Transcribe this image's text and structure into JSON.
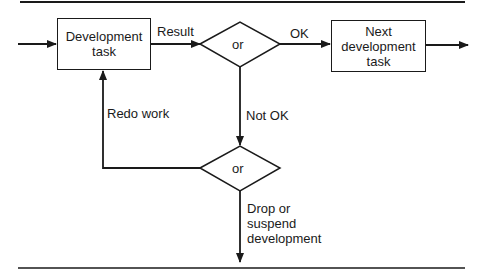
{
  "diagram": {
    "nodes": {
      "development_task": {
        "label": "Development task",
        "line1": "Development",
        "line2": "task"
      },
      "decision_1": {
        "label": "or"
      },
      "next_task": {
        "label": "Next development task",
        "line1": "Next",
        "line2": "development",
        "line3": "task"
      },
      "decision_2": {
        "label": "or"
      }
    },
    "edges": {
      "result": "Result",
      "ok": "OK",
      "not_ok": "Not OK",
      "redo": "Redo work",
      "drop_line1": "Drop or",
      "drop_line2": "suspend",
      "drop_line3": "development"
    }
  }
}
